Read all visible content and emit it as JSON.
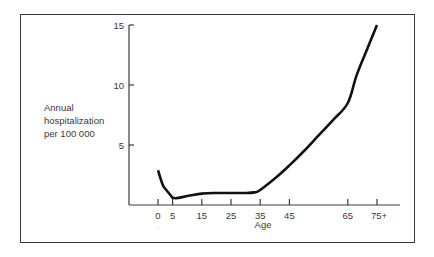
{
  "chart_data": {
    "type": "line",
    "title": "",
    "xlabel": "Age",
    "ylabel_lines": [
      "Annual",
      "hospitalization",
      "per 100 000"
    ],
    "x_ticks": [
      {
        "value": 0,
        "label": "0"
      },
      {
        "value": 5,
        "label": "5"
      },
      {
        "value": 15,
        "label": "15"
      },
      {
        "value": 25,
        "label": "25"
      },
      {
        "value": 35,
        "label": "35"
      },
      {
        "value": 45,
        "label": "45"
      },
      {
        "value": 65,
        "label": "65"
      },
      {
        "value": 75,
        "label": "75+"
      }
    ],
    "y_ticks": [
      {
        "value": 5,
        "label": "5"
      },
      {
        "value": 10,
        "label": "10"
      },
      {
        "value": 15,
        "label": "15"
      }
    ],
    "xlim": [
      -10,
      82
    ],
    "ylim": [
      0,
      15
    ],
    "grid": false,
    "legend": "none",
    "series": [
      {
        "name": "Annual hospitalization per 100 000",
        "x": [
          0,
          2,
          5,
          10,
          15,
          20,
          25,
          30,
          33,
          35,
          40,
          45,
          50,
          55,
          60,
          65,
          68,
          72,
          75
        ],
        "y": [
          2.9,
          1.5,
          0.6,
          0.75,
          0.95,
          1.0,
          1.0,
          1.0,
          1.05,
          1.25,
          2.2,
          3.3,
          4.5,
          5.8,
          7.1,
          8.5,
          10.8,
          13.2,
          15.0
        ]
      }
    ],
    "colors": {
      "line": "#111111",
      "axis": "#3a3a3a",
      "frame": "#3a3a3a"
    }
  }
}
